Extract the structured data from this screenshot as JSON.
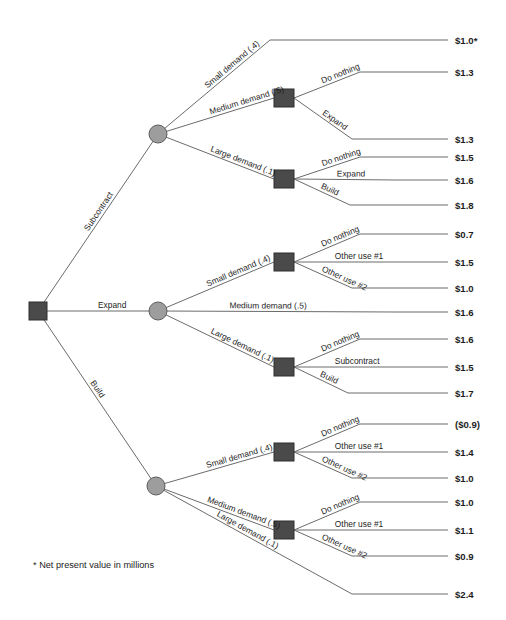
{
  "diagram": {
    "type": "decision-tree",
    "footnote": "* Net present value in millions",
    "colors": {
      "decision_node": "#4a4a4a",
      "chance_node": "#9d9d9d",
      "line": "#6b6b6b",
      "text": "#1d1d1d",
      "background": "#ffffff"
    },
    "root": {
      "name": "root-decision-node",
      "shape": "square",
      "x": 38,
      "y": 311
    },
    "nodes": [
      {
        "id": "chance-subcontract",
        "shape": "circle",
        "x": 158,
        "y": 134
      },
      {
        "id": "chance-expand",
        "shape": "circle",
        "x": 158,
        "y": 311
      },
      {
        "id": "chance-build",
        "shape": "circle",
        "x": 156,
        "y": 486
      },
      {
        "id": "decision-sub-medium",
        "shape": "square",
        "x": 284,
        "y": 98
      },
      {
        "id": "decision-sub-large",
        "shape": "square",
        "x": 284,
        "y": 179
      },
      {
        "id": "decision-exp-small",
        "shape": "square",
        "x": 284,
        "y": 262
      },
      {
        "id": "decision-exp-large",
        "shape": "square",
        "x": 284,
        "y": 367
      },
      {
        "id": "decision-bld-small",
        "shape": "square",
        "x": 284,
        "y": 452
      },
      {
        "id": "decision-bld-medium",
        "shape": "square",
        "x": 284,
        "y": 530
      }
    ],
    "branches": [
      {
        "id": "b-subcontract",
        "label": "Subcontract",
        "from": [
          38,
          311
        ],
        "to": [
          158,
          134
        ],
        "label_t": 0.44
      },
      {
        "id": "b-expand",
        "label": "Expand",
        "from": [
          38,
          311
        ],
        "to": [
          158,
          311
        ],
        "label_t": 0.5
      },
      {
        "id": "b-build",
        "label": "Build",
        "from": [
          38,
          311
        ],
        "to": [
          156,
          486
        ],
        "label_t": 0.42
      },
      {
        "id": "b-sub-small",
        "label": "Small demand (.4)",
        "from": [
          158,
          134
        ],
        "to": [
          270,
          40
        ],
        "label_t": 0.46
      },
      {
        "id": "b-sub-medium",
        "label": "Medium demand (.5)",
        "from": [
          158,
          134
        ],
        "to": [
          274,
          98
        ],
        "label_t": 0.46
      },
      {
        "id": "b-sub-large",
        "label": "Large demand (.1)",
        "from": [
          158,
          134
        ],
        "to": [
          274,
          179
        ],
        "label_t": 0.44
      },
      {
        "id": "b-sub-med-donothing",
        "label": "Do nothing",
        "from": [
          294,
          98
        ],
        "to": [
          360,
          72
        ],
        "label_t": 0.45
      },
      {
        "id": "b-sub-med-expand",
        "label": "Expand",
        "from": [
          294,
          98
        ],
        "to": [
          352,
          139
        ],
        "label_t": 0.45
      },
      {
        "id": "b-sub-lrg-donothing",
        "label": "Do nothing",
        "from": [
          294,
          179
        ],
        "to": [
          360,
          157
        ],
        "label_t": 0.45
      },
      {
        "id": "b-sub-lrg-expand",
        "label": "Expand",
        "from": [
          294,
          179
        ],
        "to": [
          396,
          180
        ],
        "label_t": 0.42
      },
      {
        "id": "b-sub-lrg-build",
        "label": "Build",
        "from": [
          294,
          179
        ],
        "to": [
          350,
          205
        ],
        "label_t": 0.45
      },
      {
        "id": "b-exp-small",
        "label": "Small demand (.4)",
        "from": [
          158,
          311
        ],
        "to": [
          274,
          262
        ],
        "label_t": 0.44
      },
      {
        "id": "b-exp-medium",
        "label": "Medium demand (.5)",
        "from": [
          158,
          311
        ],
        "to": [
          396,
          312
        ],
        "label_t": 0.3
      },
      {
        "id": "b-exp-large",
        "label": "Large demand (.1)",
        "from": [
          158,
          311
        ],
        "to": [
          274,
          367
        ],
        "label_t": 0.44
      },
      {
        "id": "b-exp-sml-donothing",
        "label": "Do nothing",
        "from": [
          294,
          262
        ],
        "to": [
          360,
          234
        ],
        "label_t": 0.45
      },
      {
        "id": "b-exp-sml-other1",
        "label": "Other use #1",
        "from": [
          294,
          262
        ],
        "to": [
          396,
          262
        ],
        "label_t": 0.4
      },
      {
        "id": "b-exp-sml-other2",
        "label": "Other use #2",
        "from": [
          294,
          262
        ],
        "to": [
          352,
          288
        ],
        "label_t": 0.45
      },
      {
        "id": "b-exp-lrg-donothing",
        "label": "Do nothing",
        "from": [
          294,
          367
        ],
        "to": [
          360,
          339
        ],
        "label_t": 0.45
      },
      {
        "id": "b-exp-lrg-subcontract",
        "label": "Subcontract",
        "from": [
          294,
          367
        ],
        "to": [
          396,
          367
        ],
        "label_t": 0.4
      },
      {
        "id": "b-exp-lrg-build",
        "label": "Build",
        "from": [
          294,
          367
        ],
        "to": [
          348,
          393
        ],
        "label_t": 0.45
      },
      {
        "id": "b-bld-small",
        "label": "Small demand (.4)",
        "from": [
          156,
          486
        ],
        "to": [
          274,
          452
        ],
        "label_t": 0.44
      },
      {
        "id": "b-bld-medium",
        "label": "Medium demand (.5)",
        "from": [
          156,
          486
        ],
        "to": [
          274,
          530
        ],
        "label_t": 0.42
      },
      {
        "id": "b-bld-large",
        "label": "Large demand (.1)",
        "from": [
          156,
          486
        ],
        "to": [
          352,
          594
        ],
        "label_t": 0.3
      },
      {
        "id": "b-bld-sml-donothing",
        "label": "Do nothing",
        "from": [
          294,
          452
        ],
        "to": [
          360,
          424
        ],
        "label_t": 0.45
      },
      {
        "id": "b-bld-sml-other1",
        "label": "Other use #1",
        "from": [
          294,
          452
        ],
        "to": [
          396,
          452
        ],
        "label_t": 0.4
      },
      {
        "id": "b-bld-sml-other2",
        "label": "Other use #2",
        "from": [
          294,
          452
        ],
        "to": [
          352,
          478
        ],
        "label_t": 0.45
      },
      {
        "id": "b-bld-med-donothing",
        "label": "Do nothing",
        "from": [
          294,
          530
        ],
        "to": [
          360,
          502
        ],
        "label_t": 0.45
      },
      {
        "id": "b-bld-med-other1",
        "label": "Other use #1",
        "from": [
          294,
          530
        ],
        "to": [
          396,
          530
        ],
        "label_t": 0.4
      },
      {
        "id": "b-bld-med-other2",
        "label": "Other use #2",
        "from": [
          294,
          530
        ],
        "to": [
          352,
          556
        ],
        "label_t": 0.45
      }
    ],
    "terminals": [
      {
        "id": "t1",
        "value": "$1.0*",
        "y": 40,
        "lead_from": [
          270,
          40
        ]
      },
      {
        "id": "t2",
        "value": "$1.3",
        "y": 72,
        "lead_from": [
          360,
          72
        ]
      },
      {
        "id": "t3",
        "value": "$1.3",
        "y": 139,
        "lead_from": [
          352,
          139
        ]
      },
      {
        "id": "t4",
        "value": "$1.5",
        "y": 157,
        "lead_from": [
          360,
          157
        ]
      },
      {
        "id": "t5",
        "value": "$1.6",
        "y": 180,
        "lead_from": [
          396,
          180
        ]
      },
      {
        "id": "t6",
        "value": "$1.8",
        "y": 205,
        "lead_from": [
          350,
          205
        ]
      },
      {
        "id": "t7",
        "value": "$0.7",
        "y": 234,
        "lead_from": [
          360,
          234
        ]
      },
      {
        "id": "t8",
        "value": "$1.5",
        "y": 262,
        "lead_from": [
          396,
          262
        ]
      },
      {
        "id": "t9",
        "value": "$1.0",
        "y": 288,
        "lead_from": [
          352,
          288
        ]
      },
      {
        "id": "t10",
        "value": "$1.6",
        "y": 312,
        "lead_from": [
          396,
          312
        ]
      },
      {
        "id": "t11",
        "value": "$1.6",
        "y": 339,
        "lead_from": [
          360,
          339
        ]
      },
      {
        "id": "t12",
        "value": "$1.5",
        "y": 367,
        "lead_from": [
          396,
          367
        ]
      },
      {
        "id": "t13",
        "value": "$1.7",
        "y": 393,
        "lead_from": [
          348,
          393
        ]
      },
      {
        "id": "t14",
        "value": "($0.9)",
        "y": 424,
        "lead_from": [
          360,
          424
        ]
      },
      {
        "id": "t15",
        "value": "$1.4",
        "y": 452,
        "lead_from": [
          396,
          452
        ]
      },
      {
        "id": "t16",
        "value": "$1.0",
        "y": 478,
        "lead_from": [
          352,
          478
        ]
      },
      {
        "id": "t17",
        "value": "$1.0",
        "y": 502,
        "lead_from": [
          360,
          502
        ]
      },
      {
        "id": "t18",
        "value": "$1.1",
        "y": 530,
        "lead_from": [
          396,
          530
        ]
      },
      {
        "id": "t19",
        "value": "$0.9",
        "y": 556,
        "lead_from": [
          352,
          556
        ]
      },
      {
        "id": "t20",
        "value": "$2.4",
        "y": 594,
        "lead_from": [
          352,
          594
        ]
      }
    ],
    "terminal_label_x": 455,
    "terminal_line_end_x": 448,
    "footnote_pos": {
      "x": 33,
      "y": 568
    }
  }
}
